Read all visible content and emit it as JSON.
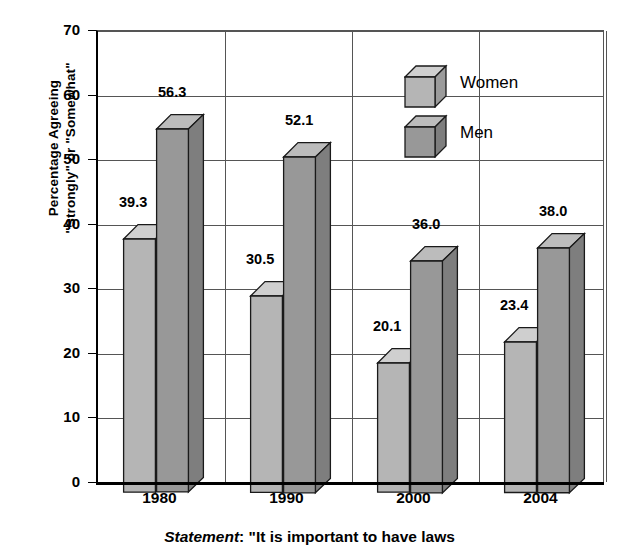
{
  "chart_data": {
    "type": "bar",
    "title": "",
    "subtitle": "",
    "xlabel": "",
    "ylabel_line1": "Percentage Agreeing",
    "ylabel_line2": "\"Strongly\" or \"Somewhat\"",
    "categories": [
      "1980",
      "1990",
      "2000",
      "2004"
    ],
    "series": [
      {
        "name": "Women",
        "values": [
          39.3,
          30.5,
          20.1,
          23.4
        ],
        "color": "#b5b5b5"
      },
      {
        "name": "Men",
        "values": [
          56.3,
          52.1,
          36.0,
          38.0
        ],
        "color": "#989898"
      }
    ],
    "value_labels": [
      [
        "39.3",
        "56.3"
      ],
      [
        "30.5",
        "52.1"
      ],
      [
        "20.1",
        "36.0"
      ],
      [
        "23.4",
        "38.0"
      ]
    ],
    "ylim": [
      0,
      70
    ],
    "yticks": [
      0,
      10,
      20,
      30,
      40,
      50,
      60,
      70
    ],
    "ytick_labels": [
      "0",
      "10",
      "20",
      "30",
      "40",
      "50",
      "60",
      "70"
    ],
    "grid": true,
    "grid_axis": "both",
    "legend_position": "top-right",
    "style": "3d-column"
  },
  "legend": {
    "items": [
      {
        "label": "Women",
        "swatch": "cube-icon-light"
      },
      {
        "label": "Men",
        "swatch": "cube-icon-dark"
      }
    ]
  },
  "caption": {
    "lead": "Statement",
    "rest": ": \"It is important to have laws"
  },
  "colors": {
    "women_front": "#b5b5b5",
    "women_top": "#cfcfcf",
    "women_side": "#9b9b9b",
    "men_front": "#989898",
    "men_top": "#bcbcbc",
    "men_side": "#7e7e7e",
    "outline": "#1a1a1a",
    "grid": "#555555",
    "axis": "#000000"
  }
}
